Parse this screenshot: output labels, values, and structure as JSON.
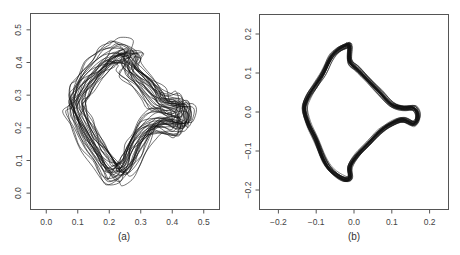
{
  "chart_data": [
    {
      "type": "line",
      "panel_label": "(a)",
      "title": "",
      "xlabel": "",
      "ylabel": "",
      "xlim": [
        -0.05,
        0.55
      ],
      "ylim": [
        -0.05,
        0.55
      ],
      "x_ticks": [
        0.0,
        0.1,
        0.2,
        0.3,
        0.4,
        0.5
      ],
      "x_tick_labels": [
        "0.0",
        "0.1",
        "0.2",
        "0.3",
        "0.4",
        "0.5"
      ],
      "y_ticks": [
        0.0,
        0.1,
        0.2,
        0.3,
        0.4,
        0.5
      ],
      "y_tick_labels": [
        "0.0",
        "0.1",
        "0.2",
        "0.3",
        "0.4",
        "0.5"
      ],
      "grid": false,
      "legend": null,
      "description": "About 30 overlaid closed curves (shape outlines), unaligned; widely spread diamond/kite shape with a right-pointing lobe",
      "n_curves": 30,
      "curve_spread": 0.035,
      "base_shape": {
        "x": [
          0.24,
          0.27,
          0.26,
          0.3,
          0.34,
          0.36,
          0.4,
          0.43,
          0.44,
          0.43,
          0.4,
          0.36,
          0.32,
          0.29,
          0.27,
          0.25,
          0.22,
          0.2,
          0.17,
          0.14,
          0.11,
          0.09,
          0.1,
          0.12,
          0.15,
          0.18,
          0.21,
          0.24
        ],
        "y": [
          0.43,
          0.42,
          0.39,
          0.35,
          0.31,
          0.28,
          0.27,
          0.27,
          0.24,
          0.21,
          0.21,
          0.22,
          0.2,
          0.16,
          0.12,
          0.08,
          0.06,
          0.08,
          0.12,
          0.17,
          0.22,
          0.27,
          0.3,
          0.33,
          0.37,
          0.4,
          0.42,
          0.43
        ]
      }
    },
    {
      "type": "line",
      "panel_label": "(b)",
      "title": "",
      "xlabel": "",
      "ylabel": "",
      "xlim": [
        -0.25,
        0.25
      ],
      "ylim": [
        -0.25,
        0.25
      ],
      "x_ticks": [
        -0.2,
        -0.1,
        0.0,
        0.1,
        0.2
      ],
      "x_tick_labels": [
        "-0.2",
        "-0.1",
        "0.0",
        "0.1",
        "0.2"
      ],
      "y_ticks": [
        -0.2,
        -0.1,
        0.0,
        0.1,
        0.2
      ],
      "y_tick_labels": [
        "-0.2",
        "-0.1",
        "0.0",
        "0.1",
        "0.2"
      ],
      "grid": false,
      "legend": null,
      "description": "About 30 overlaid closed curves after alignment (Procrustes-registered), tightly clustered; fish-like shape with tail on the right",
      "n_curves": 30,
      "curve_spread": 0.006,
      "base_shape": {
        "x": [
          -0.02,
          -0.01,
          -0.01,
          0.01,
          0.04,
          0.07,
          0.1,
          0.13,
          0.16,
          0.17,
          0.16,
          0.13,
          0.1,
          0.07,
          0.04,
          0.01,
          -0.01,
          -0.01,
          -0.03,
          -0.06,
          -0.08,
          -0.1,
          -0.12,
          -0.13,
          -0.12,
          -0.1,
          -0.08,
          -0.06,
          -0.04,
          -0.02
        ],
        "y": [
          0.17,
          0.17,
          0.13,
          0.11,
          0.08,
          0.05,
          0.02,
          0.01,
          0.01,
          -0.01,
          -0.03,
          -0.02,
          -0.03,
          -0.05,
          -0.08,
          -0.11,
          -0.14,
          -0.17,
          -0.17,
          -0.15,
          -0.12,
          -0.07,
          -0.03,
          0.01,
          0.04,
          0.07,
          0.1,
          0.14,
          0.16,
          0.17
        ]
      }
    }
  ]
}
